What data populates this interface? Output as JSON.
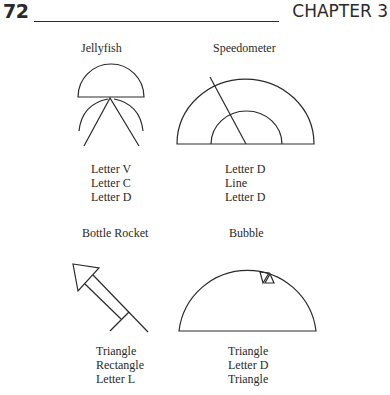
{
  "header": {
    "page_number": "72",
    "chapter": "CHAPTER 3"
  },
  "figures": [
    {
      "title": "Jellyfish",
      "parts": [
        "Letter V",
        "Letter C",
        "Letter D"
      ]
    },
    {
      "title": "Speedometer",
      "parts": [
        "Letter D",
        "Line",
        "Letter D"
      ]
    },
    {
      "title": "Bottle Rocket",
      "parts": [
        "Triangle",
        "Rectangle",
        "Letter L"
      ]
    },
    {
      "title": "Bubble",
      "parts": [
        "Triangle",
        "Letter D",
        "Triangle"
      ]
    }
  ]
}
